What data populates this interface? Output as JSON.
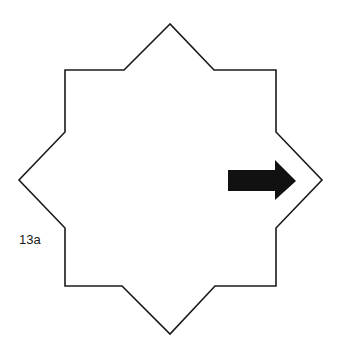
{
  "figure": {
    "label": "13a",
    "shape": "eight-pointed-star",
    "stroke_color": "#1a1a1a",
    "arrow_color": "#111111",
    "arrow_direction": "right"
  }
}
